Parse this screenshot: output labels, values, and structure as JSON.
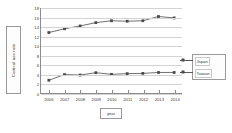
{
  "chart_data": {
    "type": "line",
    "title": "",
    "xlabel": "year",
    "ylabel": "Cortical use rate",
    "x": [
      "2006",
      "2007",
      "2008",
      "2009",
      "2010",
      "2011",
      "2012",
      "2013",
      "2014"
    ],
    "categories": [
      "2006",
      "2007",
      "2008",
      "2009",
      "2010",
      "2011",
      "2012",
      "2013",
      "2014"
    ],
    "ylim": [
      0,
      18
    ],
    "yticks": [
      "0",
      "2",
      "4",
      "6",
      "8",
      "10",
      "12",
      "14",
      "16",
      "18"
    ],
    "grid": true,
    "legend_position": "right",
    "series": [
      {
        "name": "Japan",
        "values": [
          12.8,
          13.6,
          14.2,
          14.9,
          15.3,
          15.2,
          15.3,
          16.2,
          15.9
        ],
        "color": "#4a4a4a",
        "marker": "square"
      },
      {
        "name": "Taiwan",
        "values": [
          2.7,
          3.9,
          3.8,
          4.3,
          3.95,
          4.1,
          4.15,
          4.35,
          4.35
        ],
        "color": "#4a4a4a",
        "marker": "square"
      }
    ]
  },
  "axes": {
    "y_title": "Cortical use rate",
    "x_title": "year"
  },
  "legend": {
    "items": [
      {
        "label": "Japan"
      },
      {
        "label": "Taiwan"
      }
    ]
  }
}
